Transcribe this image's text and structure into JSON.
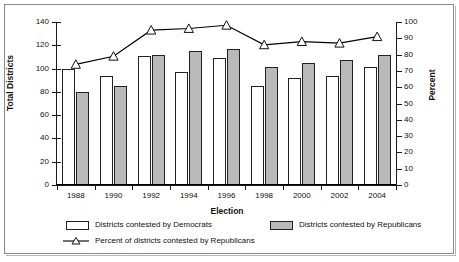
{
  "chart_data": {
    "type": "bar",
    "title": "",
    "xlabel": "Election",
    "ylabel": "Total Districts",
    "y2label": "Percent",
    "categories": [
      "1988",
      "1990",
      "1992",
      "1994",
      "1996",
      "1998",
      "2000",
      "2002",
      "2004"
    ],
    "ylim": [
      0,
      140
    ],
    "yticks": [
      0,
      20,
      40,
      60,
      80,
      100,
      120,
      140
    ],
    "y2lim": [
      0,
      100
    ],
    "y2ticks": [
      0,
      10,
      20,
      30,
      40,
      50,
      60,
      70,
      80,
      90,
      100
    ],
    "grid": false,
    "legend_position": "bottom",
    "series": [
      {
        "name": "Districts contested by Democrats",
        "type": "bar",
        "axis": "left",
        "color": "#ffffff",
        "values": [
          100,
          94,
          111,
          97,
          109,
          85,
          92,
          94,
          101
        ]
      },
      {
        "name": "Districts contested by Republicans",
        "type": "bar",
        "axis": "left",
        "color": "#b9b9b9",
        "values": [
          80,
          85,
          112,
          115,
          117,
          101,
          105,
          107,
          112
        ]
      },
      {
        "name": "Percent of districts contested by Republicans",
        "type": "line",
        "axis": "right",
        "marker": "triangle",
        "color": "#000000",
        "values": [
          74,
          79,
          95,
          96,
          98,
          86,
          88,
          87,
          91
        ]
      }
    ]
  },
  "axes": {
    "left": {
      "title": "Total Districts",
      "ticks": [
        "140",
        "120",
        "100",
        "80",
        "60",
        "40",
        "20",
        "0"
      ]
    },
    "right": {
      "title": "Percent",
      "ticks": [
        "100",
        "90",
        "80",
        "70",
        "60",
        "50",
        "40",
        "30",
        "20",
        "10",
        "0"
      ]
    },
    "bottom": {
      "title": "Election",
      "ticks": [
        "1988",
        "1990",
        "1992",
        "1994",
        "1996",
        "1998",
        "2000",
        "2002",
        "2004"
      ]
    }
  },
  "legend": {
    "items": [
      {
        "label": "Districts contested by Democrats",
        "marker": "white-square-swatch"
      },
      {
        "label": "Districts contested by Republicans",
        "marker": "gray-square-swatch"
      },
      {
        "label": "Percent of districts contested by Republicans",
        "marker": "triangle-line-swatch"
      }
    ]
  }
}
